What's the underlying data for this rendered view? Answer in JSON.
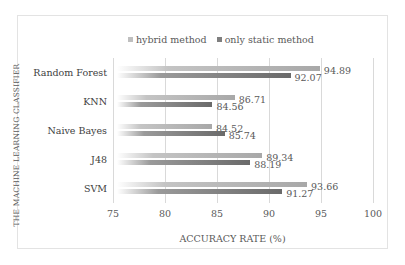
{
  "chart_data": {
    "type": "bar",
    "orientation": "horizontal",
    "title": "",
    "xlabel": "ACCURACY RATE (%)",
    "ylabel": "THE MACHINE LEARNING CLASSIFIER",
    "xlim": [
      75,
      100
    ],
    "xticks": [
      "75",
      "80",
      "85",
      "90",
      "95",
      "100"
    ],
    "grid": true,
    "legend_position": "top",
    "categories": [
      "Random Forest",
      "KNN",
      "Naive Bayes",
      "J48",
      "SVM"
    ],
    "series": [
      {
        "name": "hybrid method",
        "color": "#a6a6a6",
        "values": [
          94.89,
          86.71,
          84.52,
          89.34,
          93.66
        ]
      },
      {
        "name": "only static method",
        "color": "#7f7f7f",
        "values": [
          92.07,
          84.56,
          85.74,
          88.19,
          91.27
        ]
      }
    ],
    "data_labels": {
      "hybrid": [
        "94.89",
        "86.71",
        "84.52",
        "89.34",
        "93.66"
      ],
      "static": [
        "92.07",
        "84.56",
        "85.74",
        "88.19",
        "91.27"
      ]
    }
  },
  "legend": {
    "hybrid": "hybrid method",
    "static": "only static method"
  },
  "axes": {
    "xlabel": "ACCURACY RATE (%)",
    "ylabel": "THE MACHINE LEARNING CLASSIFIER",
    "ticks": [
      "75",
      "80",
      "85",
      "90",
      "95",
      "100"
    ]
  },
  "categories": [
    "Random Forest",
    "KNN",
    "Naive Bayes",
    "J48",
    "SVM"
  ]
}
